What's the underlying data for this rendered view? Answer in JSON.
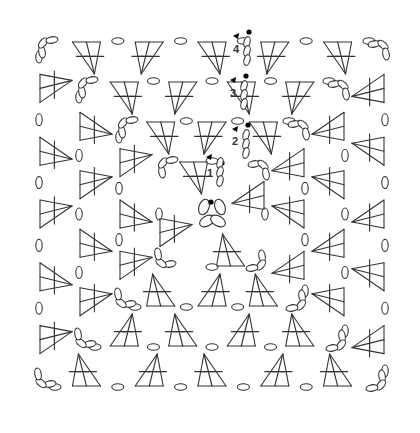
{
  "diagram": {
    "type": "crochet-chart",
    "rounds": [
      {
        "label": "1",
        "half": 52,
        "groups_per_side": 1
      },
      {
        "label": "2",
        "half": 92,
        "groups_per_side": 2
      },
      {
        "label": "3",
        "half": 132,
        "groups_per_side": 3
      },
      {
        "label": "4",
        "half": 172,
        "groups_per_side": 4
      }
    ],
    "center": {
      "x": 212,
      "y": 214
    },
    "round_labels": [
      {
        "text": "1",
        "x": 207,
        "y": 173
      },
      {
        "text": "2",
        "x": 233,
        "y": 145
      },
      {
        "text": "3",
        "x": 231,
        "y": 96
      },
      {
        "text": "4",
        "x": 234,
        "y": 52
      }
    ],
    "colors": {
      "line": "#333333",
      "marker": "#000000",
      "background": "#ffffff"
    }
  }
}
